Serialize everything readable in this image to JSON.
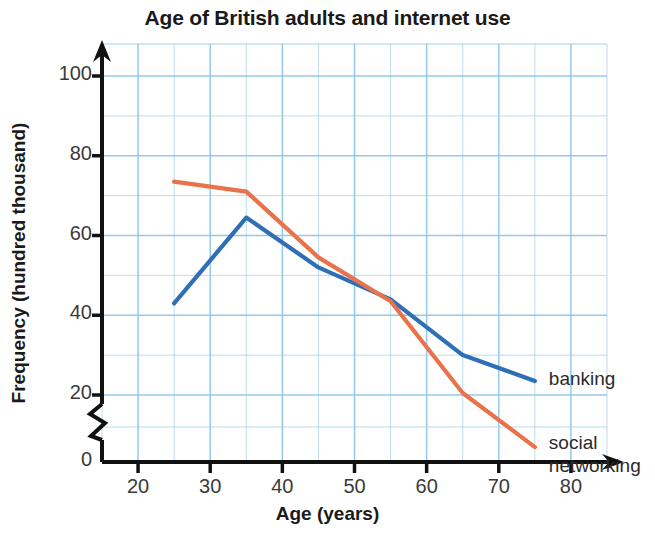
{
  "chart_data": {
    "type": "line",
    "title": "Age of British adults and internet use",
    "xlabel": "Age (years)",
    "ylabel": "Frequency (hundred thousand)",
    "x": [
      25,
      35,
      45,
      55,
      65,
      75
    ],
    "series": [
      {
        "name": "banking",
        "color": "#2f6fb5",
        "values": [
          43,
          64.5,
          52,
          44,
          30,
          23.5
        ]
      },
      {
        "name": "social networking",
        "color": "#e8734a",
        "values": [
          73.5,
          71,
          54.5,
          43.5,
          20.5,
          11
        ]
      }
    ],
    "xlim": [
      15,
      85
    ],
    "ylim": [
      0,
      110
    ],
    "x_ticks": [
      20,
      30,
      40,
      50,
      60,
      70,
      80
    ],
    "x_tick_labels": [
      "20",
      "30",
      "40",
      "50",
      "60",
      "70",
      "80"
    ],
    "y_ticks": [
      0,
      20,
      40,
      60,
      80,
      100
    ],
    "y_tick_labels": [
      "0",
      "20",
      "40",
      "60",
      "80",
      "100"
    ],
    "x_minor_step": 5,
    "y_minor_step": 10,
    "grid": true,
    "grid_color": "#8ec6ea",
    "axis_break_y": true,
    "axis_break_between": [
      0,
      20
    ],
    "legend_position": "inline-right",
    "legend": [
      {
        "label": "banking",
        "color": "#2f6fb5"
      },
      {
        "label_line1": "social",
        "label_line2": "networking",
        "color": "#e8734a"
      }
    ]
  },
  "labels": {
    "banking": "banking",
    "social_line1": "social",
    "social_line2": "networking"
  }
}
